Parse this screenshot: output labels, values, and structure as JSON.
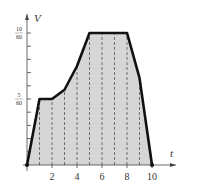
{
  "chart_data": {
    "type": "area",
    "title": "",
    "xlabel": "t",
    "ylabel": "V",
    "xlim": [
      0,
      10.5
    ],
    "ylim": [
      0,
      0.19
    ],
    "x_ticks": [
      2,
      4,
      6,
      8,
      10
    ],
    "x_tick_labels": [
      "2",
      "4",
      "6",
      "8",
      "10"
    ],
    "y_ticks": [
      0.0833,
      0.1667
    ],
    "y_tick_labels": [
      "5/60",
      "10/60"
    ],
    "y_minor_ticks_count": 9,
    "grid": false,
    "legend": null,
    "dashed_verticals_at": [
      1,
      2,
      3,
      4,
      5,
      6,
      7,
      8,
      9
    ],
    "series": [
      {
        "name": "V(t)",
        "x": [
          0,
          1,
          2,
          3,
          4,
          5,
          6,
          7,
          8,
          9,
          10
        ],
        "values": [
          0,
          0.0833,
          0.0833,
          0.095,
          0.125,
          0.1667,
          0.1667,
          0.1667,
          0.1667,
          0.11,
          0
        ]
      }
    ],
    "fill_color": "#d6d6d6",
    "line_color": "#111111"
  }
}
